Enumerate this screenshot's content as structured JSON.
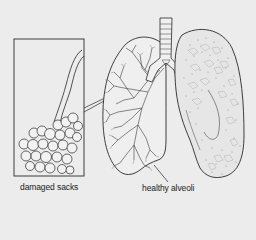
{
  "diagram": {
    "labels": {
      "damaged": "damaged sacks",
      "healthy": "healthy alveoli"
    },
    "colors": {
      "background": "#ececec",
      "ink": "#2a2a2a",
      "texture": "#6a6a6a"
    }
  }
}
